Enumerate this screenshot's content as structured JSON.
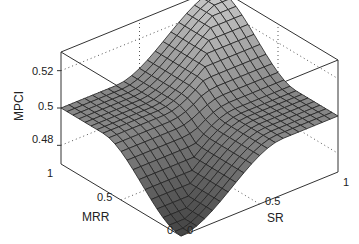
{
  "chart_data": {
    "type": "surface3d",
    "title": "",
    "xlabel": "SR",
    "ylabel": "MRR",
    "zlabel": "MPCI",
    "x_ticks": [
      "0",
      "0.5",
      "1"
    ],
    "y_ticks": [
      "0",
      "0.5",
      "1"
    ],
    "z_ticks": [
      "0.48",
      "0.5",
      "0.52"
    ],
    "xlim": [
      0,
      1
    ],
    "ylim": [
      0,
      1
    ],
    "zlim": [
      0.47,
      0.53
    ],
    "grid": false,
    "colormap": "gray",
    "samples": [
      {
        "SR": 0,
        "MRR": 0,
        "MPCI": 0.47
      },
      {
        "SR": 0.5,
        "MRR": 0.5,
        "MPCI": 0.5
      },
      {
        "SR": 1,
        "MRR": 1,
        "MPCI": 0.53
      },
      {
        "SR": 1,
        "MRR": 0,
        "MPCI": 0.5
      },
      {
        "SR": 0,
        "MRR": 1,
        "MPCI": 0.5
      }
    ]
  },
  "labels": {
    "z_axis": "MPCI",
    "x_axis": "SR",
    "y_axis": "MRR",
    "z_tick_052": "0.52",
    "z_tick_050": "0.5",
    "z_tick_048": "0.48",
    "y_tick_1": "1",
    "y_tick_05": "0.5",
    "y_tick_0": "0",
    "x_tick_0": "0",
    "x_tick_05": "0.5",
    "x_tick_1": "1"
  }
}
